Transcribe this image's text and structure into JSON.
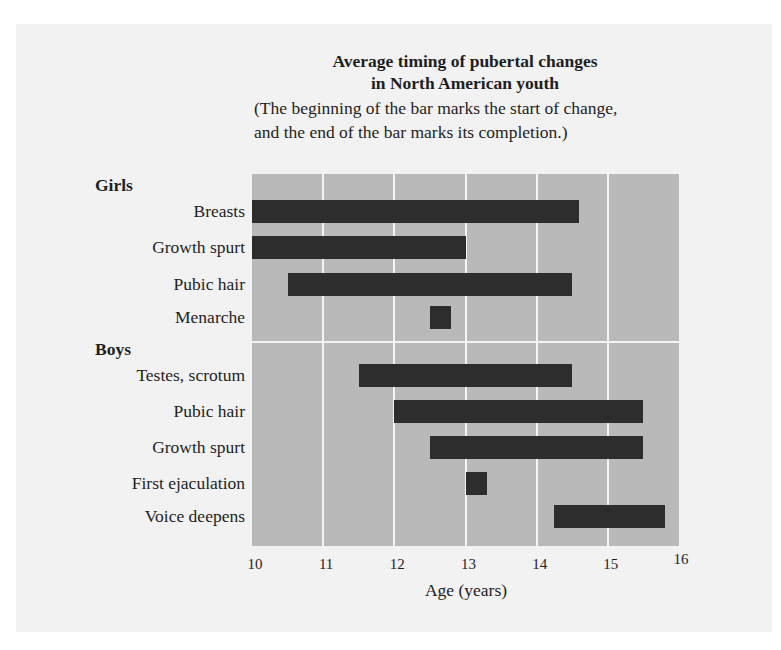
{
  "chart_data": {
    "type": "bar",
    "subtype": "horizontal-range (gantt)",
    "title": "Average timing of pubertal changes in North American youth",
    "title_lines": [
      "Average timing of pubertal changes",
      "in North American youth"
    ],
    "subtitle_lines": [
      "(The beginning of the bar marks the start of change,",
      "and the end of the bar marks its completion.)"
    ],
    "xlabel": "Age (years)",
    "ylabel": "",
    "xlim": [
      10,
      16
    ],
    "xticks": [
      10,
      11,
      12,
      13,
      14,
      15,
      16
    ],
    "grid": true,
    "legend": null,
    "groups": [
      {
        "name": "Girls",
        "items": [
          {
            "label": "Breasts",
            "start": 10.0,
            "end": 14.6
          },
          {
            "label": "Growth spurt",
            "start": 10.0,
            "end": 13.0
          },
          {
            "label": "Pubic hair",
            "start": 10.5,
            "end": 14.5
          },
          {
            "label": "Menarche",
            "start": 12.5,
            "end": 12.8
          }
        ]
      },
      {
        "name": "Boys",
        "items": [
          {
            "label": "Testes, scrotum",
            "start": 11.5,
            "end": 14.5
          },
          {
            "label": "Pubic hair",
            "start": 12.0,
            "end": 15.5
          },
          {
            "label": "Growth spurt",
            "start": 12.5,
            "end": 15.5
          },
          {
            "label": "First ejaculation",
            "start": 13.0,
            "end": 13.3
          },
          {
            "label": "Voice deepens",
            "start": 14.25,
            "end": 15.8
          }
        ]
      }
    ],
    "colors": {
      "bar": "#2d2d2d",
      "plot_background": "#b9b9b9",
      "grid": "#f4f4f4"
    }
  }
}
